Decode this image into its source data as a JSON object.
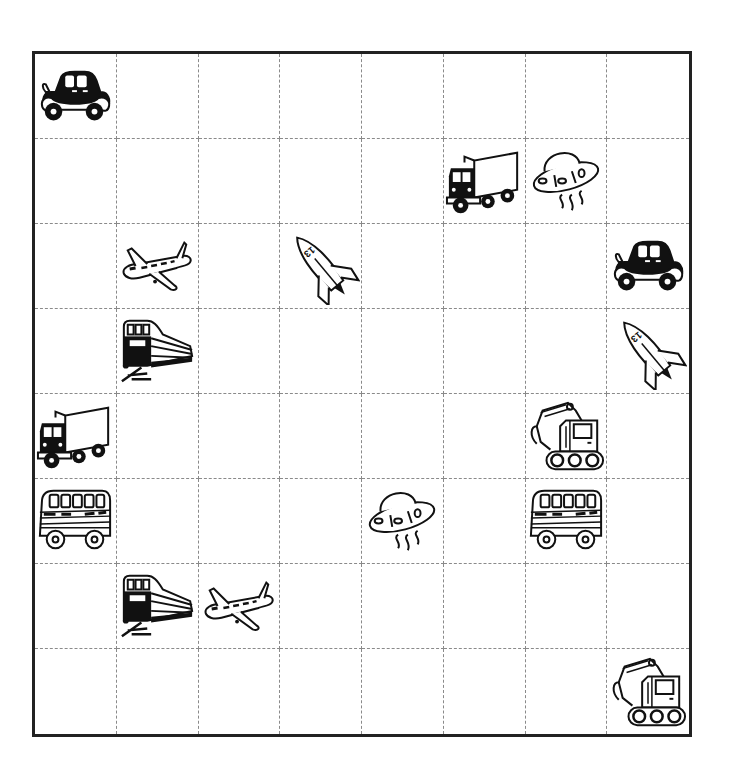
{
  "grid": {
    "rows": 8,
    "cols": 8,
    "border_color": "#222222",
    "line_color": "#8a8a8a",
    "line_style": "dashed"
  },
  "items": [
    {
      "row": 0,
      "col": 0,
      "icon": "car-icon",
      "label": "car"
    },
    {
      "row": 1,
      "col": 5,
      "icon": "truck-icon",
      "label": "truck"
    },
    {
      "row": 1,
      "col": 6,
      "icon": "ufo-icon",
      "label": "ufo"
    },
    {
      "row": 2,
      "col": 1,
      "icon": "airplane-icon",
      "label": "airplane"
    },
    {
      "row": 2,
      "col": 3,
      "icon": "rocket-icon",
      "label": "rocket",
      "text": "13"
    },
    {
      "row": 2,
      "col": 7,
      "icon": "car-icon",
      "label": "car"
    },
    {
      "row": 3,
      "col": 1,
      "icon": "train-icon",
      "label": "train"
    },
    {
      "row": 3,
      "col": 7,
      "icon": "rocket-icon",
      "label": "rocket",
      "text": "13"
    },
    {
      "row": 4,
      "col": 0,
      "icon": "truck-icon",
      "label": "truck"
    },
    {
      "row": 4,
      "col": 6,
      "icon": "excavator-icon",
      "label": "excavator"
    },
    {
      "row": 5,
      "col": 0,
      "icon": "bus-icon",
      "label": "bus"
    },
    {
      "row": 5,
      "col": 4,
      "icon": "ufo-icon",
      "label": "ufo"
    },
    {
      "row": 5,
      "col": 6,
      "icon": "bus-icon",
      "label": "bus"
    },
    {
      "row": 6,
      "col": 1,
      "icon": "train-icon",
      "label": "train"
    },
    {
      "row": 6,
      "col": 2,
      "icon": "airplane-icon",
      "label": "airplane"
    },
    {
      "row": 7,
      "col": 7,
      "icon": "excavator-icon",
      "label": "excavator"
    }
  ]
}
